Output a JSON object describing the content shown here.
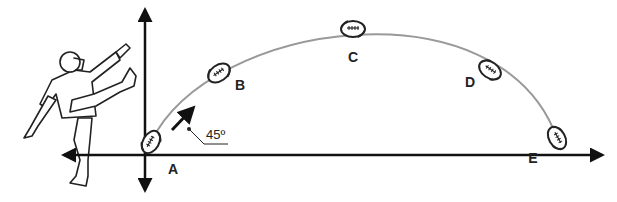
{
  "diagram": {
    "title": "",
    "launch_angle_label": "45º",
    "points": [
      {
        "label": "A",
        "x": 151,
        "y": 142,
        "lx": 173,
        "ly": 168
      },
      {
        "label": "B",
        "x": 219,
        "y": 73,
        "lx": 240,
        "ly": 90
      },
      {
        "label": "C",
        "x": 353,
        "y": 29,
        "lx": 353,
        "ly": 62
      },
      {
        "label": "D",
        "x": 490,
        "y": 70,
        "lx": 469,
        "ly": 86
      },
      {
        "label": "E",
        "x": 557,
        "y": 138,
        "lx": 533,
        "ly": 162
      }
    ],
    "colors": {
      "axis": "#111111",
      "trajectory": "#999999",
      "ink": "#222222"
    }
  }
}
